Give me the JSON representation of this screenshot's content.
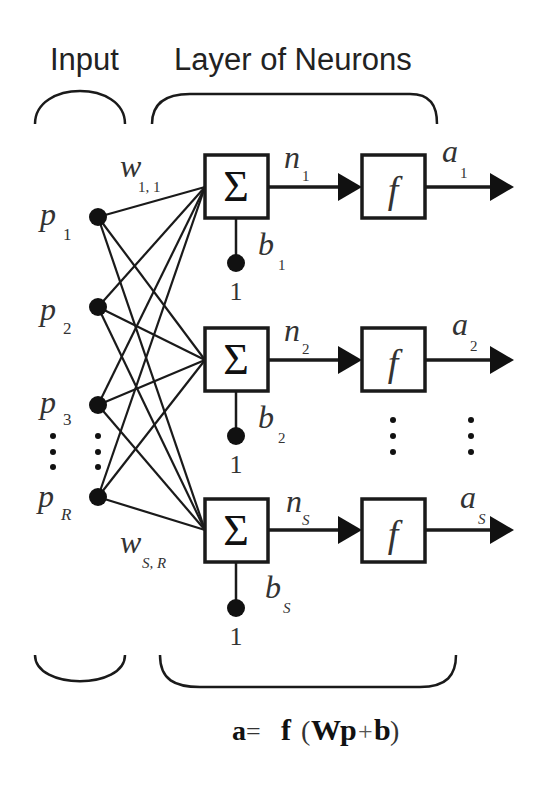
{
  "headers": {
    "input": "Input",
    "layer": "Layer of Neurons"
  },
  "inputs": [
    {
      "label": "p",
      "sub": "1"
    },
    {
      "label": "p",
      "sub": "2"
    },
    {
      "label": "p",
      "sub": "3"
    },
    {
      "label": "p",
      "sub": "R"
    }
  ],
  "weights": {
    "first": {
      "label": "w",
      "sub": "1, 1"
    },
    "last": {
      "label": "w",
      "sub": "S, R"
    }
  },
  "neurons": [
    {
      "sum_symbol": "Σ",
      "bias": "b",
      "bias_sub": "1",
      "bias_input": "1",
      "net": "n",
      "net_sub": "1",
      "func": "f",
      "out": "a",
      "out_sub": "1"
    },
    {
      "sum_symbol": "Σ",
      "bias": "b",
      "bias_sub": "2",
      "bias_input": "1",
      "net": "n",
      "net_sub": "2",
      "func": "f",
      "out": "a",
      "out_sub": "2"
    },
    {
      "sum_symbol": "Σ",
      "bias": "b",
      "bias_sub": "S",
      "bias_input": "1",
      "net": "n",
      "net_sub": "S",
      "func": "f",
      "out": "a",
      "out_sub": "S"
    }
  ],
  "equation": {
    "a": "a",
    "eq": "=",
    "f": "f",
    "lparen": "(",
    "W": "W",
    "p": "p",
    "plus": "+",
    "b": "b",
    "rparen": ")"
  },
  "colors": {
    "stroke": "#1a1a1a",
    "text": "#333333",
    "background": "#ffffff"
  }
}
